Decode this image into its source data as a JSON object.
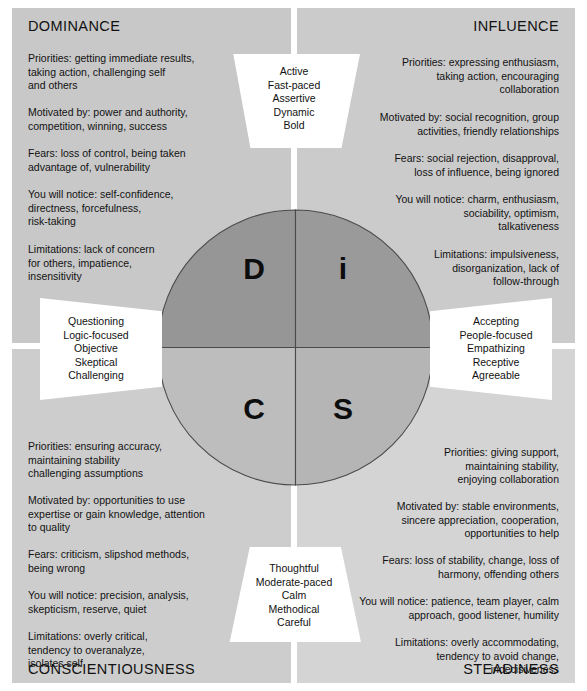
{
  "colors": {
    "quadrant_dominance_bg": "#c8c8c8",
    "quadrant_influence_bg": "#cbcbcb",
    "quadrant_conscientiousness_bg": "#cdcdcd",
    "quadrant_steadiness_bg": "#d4d4d4",
    "circle_d_fill": "#969696",
    "circle_i_fill": "#9a9a9a",
    "circle_c_fill": "#bdbdbd",
    "circle_s_fill": "#b5b5b5",
    "circle_stroke": "#4a4a4a",
    "callout_bg": "#ffffff",
    "text": "#111111",
    "page_bg": "#ffffff"
  },
  "circle": {
    "letters": {
      "dominance": "D",
      "influence": "i",
      "conscientiousness": "C",
      "steadiness": "S"
    }
  },
  "quadrants": {
    "dominance": {
      "heading": "DOMINANCE",
      "priorities": "Priorities: getting immediate results,\ntaking action, challenging self\nand others",
      "motivated_by": "Motivated by: power and authority,\ncompetition, winning, success",
      "fears": "Fears: loss of control, being taken\nadvantage of, vulnerability",
      "you_will_notice": "You will notice: self-confidence,\ndirectness, forcefulness,\nrisk-taking",
      "limitations": "Limitations: lack of concern\nfor others, impatience,\ninsensitivity"
    },
    "influence": {
      "heading": "INFLUENCE",
      "priorities": "Priorities: expressing enthusiasm,\ntaking action, encouraging\ncollaboration",
      "motivated_by": "Motivated by: social recognition, group\nactivities, friendly relationships",
      "fears": "Fears: social rejection, disapproval,\nloss of influence, being ignored",
      "you_will_notice": "You will notice: charm, enthusiasm,\nsociability, optimism,\ntalkativeness",
      "limitations": "Limitations: impulsiveness,\ndisorganization, lack of\nfollow-through"
    },
    "conscientiousness": {
      "heading": "CONSCIENTIOUSNESS",
      "priorities": "Priorities: ensuring accuracy,\nmaintaining stability\nchallenging assumptions",
      "motivated_by": "Motivated by: opportunities to use\nexpertise or gain knowledge, attention\nto quality",
      "fears": "Fears: criticism, slipshod methods,\nbeing wrong",
      "you_will_notice": "You will notice: precision, analysis,\nskepticism, reserve, quiet",
      "limitations": "Limitations: overly critical,\ntendency to overanalyze,\nisolates self"
    },
    "steadiness": {
      "heading": "STEADINESS",
      "priorities": "Priorities: giving support,\nmaintaining stability,\nenjoying collaboration",
      "motivated_by": "Motivated by: stable environments,\nsincere appreciation, cooperation,\nopportunities to help",
      "fears": "Fears: loss of stability, change, loss of\nharmony, offending others",
      "you_will_notice": "You will notice: patience, team player, calm\napproach, good listener, humility",
      "limitations": "Limitations: overly accommodating,\ntendency to avoid change,\nindecisiveness"
    }
  },
  "callouts": {
    "top": "Active\nFast-paced\nAssertive\nDynamic\nBold",
    "right": "Accepting\nPeople-focused\nEmpathizing\nReceptive\nAgreeable",
    "bottom": "Thoughtful\nModerate-paced\nCalm\nMethodical\nCareful",
    "left": "Questioning\nLogic-focused\nObjective\nSkeptical\nChallenging"
  }
}
